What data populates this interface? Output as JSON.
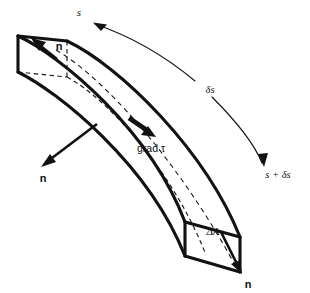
{
  "figure": {
    "kind": "line-diagram",
    "background_color": "#ffffff",
    "line_color": "#111111"
  },
  "labels": {
    "s": "s",
    "delta_s": "δs",
    "s_plus_delta_s": "s + δs",
    "grad_tau": "grad τ",
    "delta_area": "ΔA",
    "normal_top_left": "n",
    "normal_side_left": "n",
    "normal_bottom_right": "n"
  },
  "annotations": {
    "arc_upper_name": "arc-length-arrow-to-s",
    "arc_lower_name": "arc-length-arrow-to-s-plus-delta-s",
    "grad_arrow_name": "grad-tau-arrow",
    "normal_vectors_count": 3
  }
}
